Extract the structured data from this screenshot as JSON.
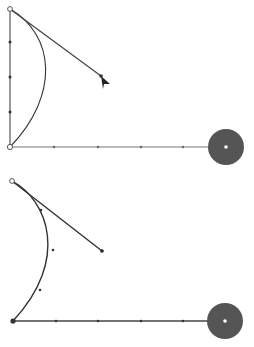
{
  "colors": {
    "background": "#ffffff",
    "line": "#555555",
    "curve": "#333333",
    "handle_line": "#444444",
    "disc": "#555555",
    "vertex_dot": "#ffffff",
    "node_fill": "#333333"
  },
  "panels": [
    {
      "name": "top-panel",
      "origin": [
        10,
        147
      ],
      "corner_top": [
        10,
        9
      ],
      "horizontal_end": [
        226,
        147
      ],
      "vertical_ticks_y": [
        42,
        77,
        112
      ],
      "horizontal_ticks_x": [
        54,
        98,
        141,
        183
      ],
      "curve_path": "M10,9 C55,35 60,95 10,147",
      "tangent_start": [
        10,
        9
      ],
      "tangent_end": [
        101,
        76
      ],
      "cursor": [
        103,
        78
      ],
      "disc_center": [
        226,
        147
      ],
      "disc_radius": 18,
      "has_vertical_axis": true,
      "has_cursor": true
    },
    {
      "name": "bottom-panel",
      "origin": [
        13,
        321
      ],
      "corner_top": [
        12,
        181
      ],
      "horizontal_end": [
        226,
        321
      ],
      "vertical_ticks_y": [],
      "horizontal_ticks_x": [
        56,
        98,
        141,
        183
      ],
      "curve_path": "M12,181 C48,200 70,260 13,321",
      "tangent_start": [
        12,
        181
      ],
      "tangent_end": [
        102,
        251
      ],
      "curve_ticks": [
        [
          41,
          210
        ],
        [
          53,
          250
        ],
        [
          40,
          290
        ]
      ],
      "disc_center": [
        225,
        321
      ],
      "disc_radius": 18,
      "has_vertical_axis": false,
      "has_cursor": false
    }
  ]
}
